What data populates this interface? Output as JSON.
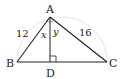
{
  "diagram": {
    "type": "right-triangle-with-altitude",
    "points": {
      "A": {
        "label": "A",
        "x": 50,
        "y": 17
      },
      "B": {
        "label": "B",
        "x": 17,
        "y": 62
      },
      "C": {
        "label": "C",
        "x": 107,
        "y": 62
      },
      "D": {
        "label": "D",
        "x": 50,
        "y": 62
      }
    },
    "side_labels": {
      "AB": "12",
      "AC": "16"
    },
    "angle_labels": {
      "BAD": "x",
      "DAC": "y"
    },
    "right_angle_at": "D",
    "circumcircle": "dotted arc through B, A, C"
  }
}
